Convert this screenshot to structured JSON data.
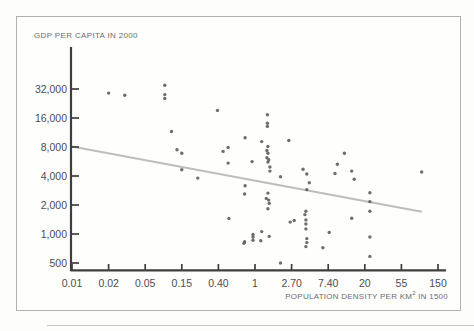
{
  "chart_data": {
    "type": "scatter",
    "ylabel": "GDP PER CAPITA IN 2000",
    "xlabel_prefix": "POPULATION DENSITY PER KM",
    "xlabel_sup": "2",
    "xlabel_suffix": " IN 1500",
    "x_scale": "log",
    "y_scale": "log",
    "x_ticks": [
      {
        "label": "0.01",
        "value": 0.01
      },
      {
        "label": "0.02",
        "value": 0.02
      },
      {
        "label": "0.05",
        "value": 0.05
      },
      {
        "label": "0.15",
        "value": 0.15
      },
      {
        "label": "0.40",
        "value": 0.4
      },
      {
        "label": "1",
        "value": 1
      },
      {
        "label": "2.70",
        "value": 2.7
      },
      {
        "label": "7.40",
        "value": 7.4
      },
      {
        "label": "20",
        "value": 20
      },
      {
        "label": "55",
        "value": 55
      },
      {
        "label": "150",
        "value": 150
      }
    ],
    "y_ticks": [
      {
        "label": "500",
        "value": 500
      },
      {
        "label": "1,000",
        "value": 1000
      },
      {
        "label": "2,000",
        "value": 2000
      },
      {
        "label": "4,000",
        "value": 4000
      },
      {
        "label": "8,000",
        "value": 8000
      },
      {
        "label": "16,000",
        "value": 16000
      },
      {
        "label": "32,000",
        "value": 32000
      }
    ],
    "x_range": [
      0.01,
      150
    ],
    "y_range": [
      500,
      32000
    ],
    "grid": false,
    "legend": "none",
    "points": [
      [
        0.02,
        29000
      ],
      [
        0.03,
        27500
      ],
      [
        0.09,
        35000
      ],
      [
        0.09,
        28000
      ],
      [
        0.09,
        25500
      ],
      [
        0.11,
        11600
      ],
      [
        0.13,
        7500
      ],
      [
        0.15,
        6900
      ],
      [
        0.15,
        4650
      ],
      [
        0.23,
        3800
      ],
      [
        0.39,
        19200
      ],
      [
        0.45,
        7200
      ],
      [
        0.51,
        7900
      ],
      [
        0.51,
        5450
      ],
      [
        0.52,
        1450
      ],
      [
        0.76,
        800
      ],
      [
        0.77,
        830
      ],
      [
        0.78,
        10000
      ],
      [
        0.78,
        3170
      ],
      [
        0.77,
        2600
      ],
      [
        0.93,
        5650
      ],
      [
        0.95,
        990
      ],
      [
        0.95,
        930
      ],
      [
        0.95,
        860
      ],
      [
        1.17,
        850
      ],
      [
        1.2,
        1060
      ],
      [
        1.2,
        9100
      ],
      [
        1.4,
        17300
      ],
      [
        1.4,
        14100
      ],
      [
        1.4,
        13100
      ],
      [
        1.42,
        8100
      ],
      [
        1.38,
        7350
      ],
      [
        1.42,
        6900
      ],
      [
        1.38,
        6200
      ],
      [
        1.45,
        5900
      ],
      [
        1.42,
        5570
      ],
      [
        1.5,
        4960
      ],
      [
        1.5,
        4500
      ],
      [
        1.42,
        2660
      ],
      [
        1.36,
        2340
      ],
      [
        1.45,
        2250
      ],
      [
        1.47,
        2080
      ],
      [
        1.42,
        1830
      ],
      [
        1.47,
        945
      ],
      [
        2.0,
        3930
      ],
      [
        2.0,
        500
      ],
      [
        2.5,
        9340
      ],
      [
        2.6,
        1330
      ],
      [
        2.9,
        1380
      ],
      [
        3.7,
        4700
      ],
      [
        4.1,
        4200
      ],
      [
        4.4,
        3400
      ],
      [
        4.1,
        2890
      ],
      [
        4.0,
        1720
      ],
      [
        3.9,
        1590
      ],
      [
        4.0,
        1400
      ],
      [
        4.0,
        1270
      ],
      [
        4.0,
        1130
      ],
      [
        4.1,
        895
      ],
      [
        4.1,
        815
      ],
      [
        4.0,
        740
      ],
      [
        6.4,
        720
      ],
      [
        7.6,
        1040
      ],
      [
        8.9,
        4250
      ],
      [
        9.5,
        5300
      ],
      [
        11.5,
        6900
      ],
      [
        14,
        4500
      ],
      [
        15,
        3700
      ],
      [
        14,
        1460
      ],
      [
        23,
        2680
      ],
      [
        23,
        2170
      ],
      [
        23,
        1720
      ],
      [
        23,
        930
      ],
      [
        23,
        585
      ],
      [
        96,
        4400
      ]
    ],
    "trendline": {
      "x1": 0.01,
      "y1": 8100,
      "x2": 96,
      "y2": 1700
    }
  },
  "colors": {
    "background": "#fdfdfc",
    "frame_border": "#b3b1af",
    "axis": "#3e3e3e",
    "tick_label": "#4d4d4d",
    "axis_title": "#6e6c6a",
    "point": "#5d5d5d",
    "trend_line": "#bfbdbb",
    "separator": "#c6c4c2"
  }
}
